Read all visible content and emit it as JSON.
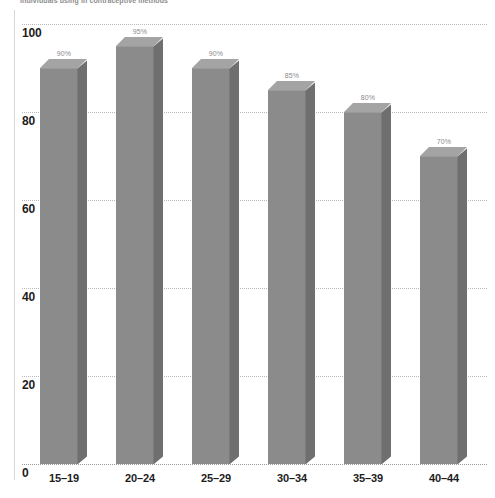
{
  "chart_data": {
    "type": "bar",
    "title": "individuals using in contraceptive methods",
    "xlabel": "",
    "ylabel": "",
    "categories": [
      "15–19",
      "20–24",
      "25–29",
      "30–34",
      "35–39",
      "40–44"
    ],
    "values": [
      90,
      95,
      90,
      85,
      80,
      70
    ],
    "data_labels": [
      "90%",
      "95%",
      "90%",
      "85%",
      "80%",
      "70%"
    ],
    "ylim": [
      0,
      100
    ],
    "yticks": [
      0,
      20,
      40,
      60,
      80,
      100
    ],
    "ytick_labels": [
      "0",
      "20",
      "40",
      "60",
      "80",
      "100"
    ],
    "grid": true,
    "grid_style": "dotted-horizontal",
    "legend": null,
    "series": [
      {
        "name": "",
        "values": [
          90,
          95,
          90,
          85,
          80,
          70
        ]
      }
    ],
    "colors": {
      "bar_front": "#8b8b8b",
      "bar_top": "#a4a4a4",
      "bar_side": "#6f6f6f",
      "gridline": "#b9b9b9",
      "axis_text": "#1c1c1c",
      "label_text": "#8a8a8a",
      "background": "#ffffff"
    }
  }
}
